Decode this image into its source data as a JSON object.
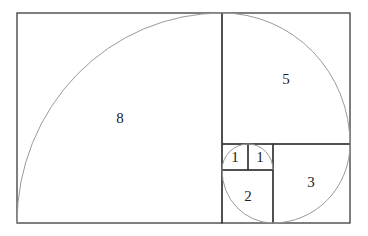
{
  "diagram": {
    "colors": {
      "squares": "#3a3a3a",
      "spiral": "#9a9a9a",
      "background": "#ffffff"
    },
    "squares": [
      {
        "label": "8",
        "x": 17,
        "y": 13,
        "w": 205,
        "h": 210,
        "lx": 120,
        "ly": 118
      },
      {
        "label": "5",
        "x": 222,
        "y": 13,
        "w": 128,
        "h": 131,
        "lx": 286,
        "ly": 79
      },
      {
        "label": "3",
        "x": 273,
        "y": 144,
        "w": 77,
        "h": 79,
        "lx": 311,
        "ly": 182
      },
      {
        "label": "2",
        "x": 222,
        "y": 170,
        "w": 51,
        "h": 53,
        "lx": 248,
        "ly": 196
      },
      {
        "label": "1",
        "x": 222,
        "y": 144,
        "w": 26,
        "h": 26,
        "lx": 235,
        "ly": 157
      },
      {
        "label": "1",
        "x": 248,
        "y": 144,
        "w": 25,
        "h": 26,
        "lx": 260,
        "ly": 157
      }
    ]
  }
}
